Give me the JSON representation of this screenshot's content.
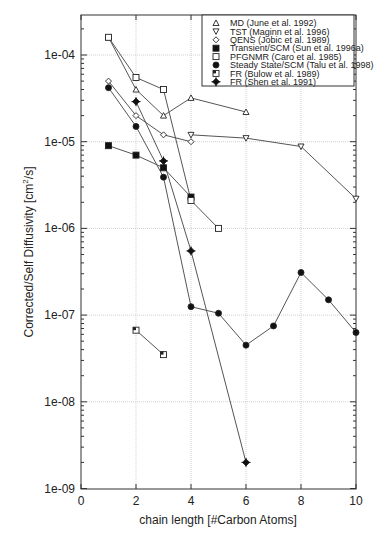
{
  "chart_data": {
    "type": "line",
    "title": "",
    "xlabel": "chain length [#Carbon Atoms]",
    "ylabel": "Corrected/Self Diffusivity [cm²/s]",
    "xlim": [
      0,
      10
    ],
    "ylim": [
      1e-09,
      0.0003
    ],
    "yscale": "log",
    "grid": true,
    "legend_position": "upper right",
    "x_ticks": [
      "0",
      "2",
      "4",
      "6",
      "8",
      "10"
    ],
    "y_ticks": [
      "1e-04",
      "1e-05",
      "1e-06",
      "1e-07",
      "1e-08",
      "1e-09"
    ],
    "series": [
      {
        "name": "MD (June et al. 1992)",
        "marker": "triangle-up-open",
        "x": [
          1,
          2,
          3,
          4,
          6
        ],
        "values": [
          0.00016,
          4e-05,
          2e-05,
          3.2e-05,
          2.2e-05
        ]
      },
      {
        "name": "TST (Maginn et al. 1996)",
        "marker": "triangle-down-open",
        "x": [
          4,
          6,
          8,
          10
        ],
        "values": [
          1.2e-05,
          1.1e-05,
          8.8e-06,
          2.2e-06
        ]
      },
      {
        "name": "QENS (Jobic et al. 1989)",
        "marker": "diamond-open",
        "x": [
          1,
          2,
          3,
          4
        ],
        "values": [
          5e-05,
          2e-05,
          1.2e-05,
          1e-05
        ]
      },
      {
        "name": "Transient/SCM (Sun et al. 1996a)",
        "marker": "square-filled",
        "x": [
          1,
          2,
          3,
          4
        ],
        "values": [
          9e-06,
          7e-06,
          5e-06,
          2.3e-06
        ]
      },
      {
        "name": "PFGNMR (Caro et al. 1985)",
        "marker": "square-open",
        "x": [
          1,
          2,
          3,
          4,
          5
        ],
        "values": [
          0.00016,
          5.5e-05,
          4e-05,
          2.1e-06,
          1e-06
        ]
      },
      {
        "name": "Steady State/SCM (Talu et al. 1998)",
        "marker": "circle-filled",
        "x": [
          1,
          2,
          3,
          4,
          5,
          6,
          7,
          8,
          9,
          10
        ],
        "values": [
          4.2e-05,
          1.5e-05,
          3.9e-06,
          1.25e-07,
          1.05e-07,
          4.5e-08,
          7.5e-08,
          3.1e-07,
          1.5e-07,
          6.3e-08
        ]
      },
      {
        "name": "FR (Bulow et al. 1989)",
        "marker": "square-half",
        "x": [
          2,
          3
        ],
        "values": [
          6.7e-08,
          3.5e-08
        ]
      },
      {
        "name": "FR (Shen et al. 1991)",
        "marker": "diamond-filled",
        "x": [
          2,
          3,
          4,
          6
        ],
        "values": [
          2.9e-05,
          6e-06,
          5.5e-07,
          2e-09
        ]
      }
    ]
  },
  "legend": {
    "items": [
      "MD (June et al. 1992)",
      "TST (Maginn et al. 1996)",
      "QENS (Jobic et al. 1989)",
      "Transient/SCM (Sun et al. 1996a)",
      "PFGNMR (Caro et al. 1985)",
      "Steady State/SCM (Talu et al. 1998)",
      "FR (Bulow et al. 1989)",
      "FR (Shen et al. 1991)"
    ]
  },
  "axes": {
    "xlabel": "chain length [#Carbon Atoms]",
    "ylabel_main": "Corrected/Self Diffusivity [cm",
    "ylabel_sup": "2",
    "ylabel_end": "/s]"
  }
}
